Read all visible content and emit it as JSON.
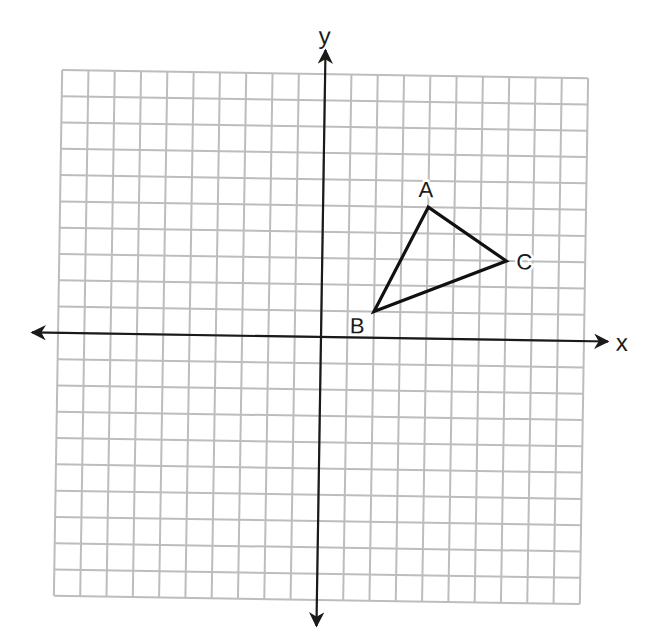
{
  "diagram": {
    "type": "coordinate-plane",
    "grid": {
      "x_min": -10,
      "x_max": 10,
      "y_min": -10,
      "y_max": 10,
      "step": 1,
      "line_color": "#bdbdbd",
      "background": "#ffffff"
    },
    "axes": {
      "x_label": "x",
      "y_label": "y",
      "color": "#1a1a1a"
    },
    "triangle": {
      "stroke_color": "#111111",
      "vertices": [
        {
          "label": "A",
          "x": 4,
          "y": 5
        },
        {
          "label": "B",
          "x": 2,
          "y": 1
        },
        {
          "label": "C",
          "x": 7,
          "y": 3
        }
      ]
    }
  }
}
